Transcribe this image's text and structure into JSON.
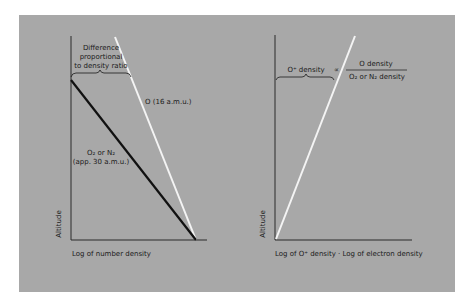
{
  "colors": {
    "panel_bg": "#a8a8a8",
    "axis": "#2a2a2a",
    "heavy_line": "#111111",
    "light_line": "#f4f4f4",
    "text": "#1a1a1a"
  },
  "left_diagram": {
    "y_axis_label": "Altitude",
    "x_axis_label": "Log of number density",
    "brace_label_line1": "Difference",
    "brace_label_line2": "proportional",
    "brace_label_line3": "to density ratio",
    "o_line_label": "O (16 a.m.u.)",
    "molecular_line_label_line1": "O₂ or N₂",
    "molecular_line_label_line2": "(app. 30 a.m.u.)"
  },
  "right_diagram": {
    "y_axis_label": "Altitude",
    "x_axis_label": "Log of O⁺ density · Log of electron density",
    "brace_label": "O⁺ density",
    "proportional_symbol": "∝",
    "fraction_numerator": "O  density",
    "fraction_denominator": "O₂ or N₂ density"
  }
}
